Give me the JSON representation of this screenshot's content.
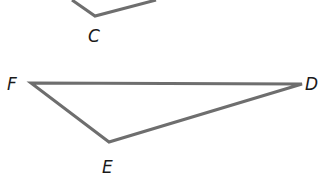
{
  "diagram": {
    "stroke_color": "#6e6e6e",
    "label_color": "#1a1a1a",
    "upper_figure": {
      "segments": [
        {
          "from": [
            72,
            0
          ],
          "to": [
            95,
            16
          ]
        },
        {
          "from": [
            95,
            16
          ],
          "to": [
            156,
            0
          ]
        }
      ],
      "vertices": [
        {
          "label": "C",
          "x": 95,
          "y": 16
        }
      ]
    },
    "triangle": {
      "vertices": [
        {
          "label": "F",
          "x": 31,
          "y": 83
        },
        {
          "label": "D",
          "x": 302,
          "y": 84
        },
        {
          "label": "E",
          "x": 109,
          "y": 142
        }
      ]
    },
    "labels": {
      "C": "C",
      "F": "F",
      "D": "D",
      "E": "E"
    }
  }
}
